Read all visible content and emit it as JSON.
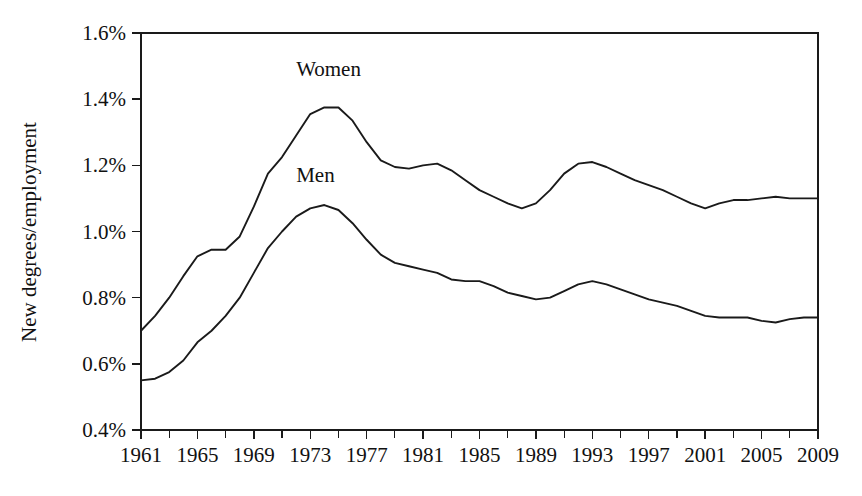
{
  "chart_data": {
    "type": "line",
    "title": "",
    "xlabel": "",
    "ylabel": "New degrees/employment",
    "xlim": [
      1961,
      2009
    ],
    "ylim": [
      0.4,
      1.6
    ],
    "grid": false,
    "legend_position": "inline-labels",
    "y_tick_labels": [
      "1.6%",
      "1.4%",
      "1.2%",
      "1.0%",
      "0.8%",
      "0.6%",
      "0.4%"
    ],
    "y_tick_values": [
      1.6,
      1.4,
      1.2,
      1.0,
      0.8,
      0.6,
      0.4
    ],
    "y_tick_step": 0.2,
    "x_tick_labels": [
      "1961",
      "1965",
      "1969",
      "1973",
      "1977",
      "1981",
      "1985",
      "1989",
      "1993",
      "1997",
      "2001",
      "2005",
      "2009"
    ],
    "x_tick_values": [
      1961,
      1965,
      1969,
      1973,
      1977,
      1981,
      1985,
      1989,
      1993,
      1997,
      2001,
      2005,
      2009
    ],
    "x_minor_step": 2,
    "x": [
      1961,
      1962,
      1963,
      1964,
      1965,
      1966,
      1967,
      1968,
      1969,
      1970,
      1971,
      1972,
      1973,
      1974,
      1975,
      1976,
      1977,
      1978,
      1979,
      1980,
      1981,
      1982,
      1983,
      1984,
      1985,
      1986,
      1987,
      1988,
      1989,
      1990,
      1991,
      1992,
      1993,
      1994,
      1995,
      1996,
      1997,
      1998,
      1999,
      2000,
      2001,
      2002,
      2003,
      2004,
      2005,
      2006,
      2007,
      2008,
      2009
    ],
    "series": [
      {
        "name": "Women",
        "label": "Women",
        "color": "#1a1a1a",
        "values": [
          0.7,
          0.745,
          0.8,
          0.865,
          0.925,
          0.945,
          0.945,
          0.985,
          1.075,
          1.175,
          1.225,
          1.29,
          1.355,
          1.375,
          1.375,
          1.335,
          1.27,
          1.215,
          1.195,
          1.19,
          1.2,
          1.205,
          1.185,
          1.155,
          1.125,
          1.105,
          1.085,
          1.07,
          1.085,
          1.125,
          1.175,
          1.205,
          1.21,
          1.195,
          1.175,
          1.155,
          1.14,
          1.125,
          1.105,
          1.085,
          1.07,
          1.085,
          1.095,
          1.095,
          1.1,
          1.105,
          1.1,
          1.1,
          1.1
        ]
      },
      {
        "name": "Men",
        "label": "Men",
        "color": "#1a1a1a",
        "values": [
          0.55,
          0.555,
          0.575,
          0.61,
          0.665,
          0.7,
          0.745,
          0.8,
          0.875,
          0.95,
          1.0,
          1.045,
          1.07,
          1.08,
          1.065,
          1.025,
          0.975,
          0.93,
          0.905,
          0.895,
          0.885,
          0.875,
          0.855,
          0.85,
          0.85,
          0.835,
          0.815,
          0.805,
          0.795,
          0.8,
          0.82,
          0.84,
          0.85,
          0.84,
          0.825,
          0.81,
          0.795,
          0.785,
          0.775,
          0.76,
          0.745,
          0.74,
          0.74,
          0.74,
          0.73,
          0.725,
          0.735,
          0.74,
          0.74
        ]
      }
    ],
    "annotations": [
      {
        "text": "Women",
        "x": 1972,
        "y": 1.47,
        "name": "women"
      },
      {
        "text": "Men",
        "x": 1972,
        "y": 1.15,
        "name": "men"
      }
    ]
  }
}
